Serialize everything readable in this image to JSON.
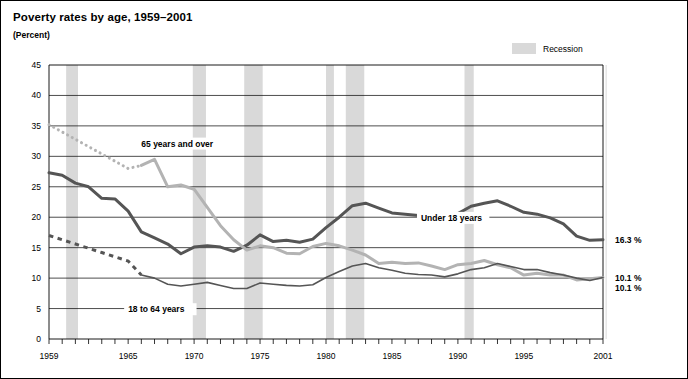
{
  "header": {
    "title": "Poverty rates by age,  1959–2001",
    "subtitle": "(Percent)"
  },
  "legend": {
    "recession_label": "Recession",
    "recession_color": "#d9d9d9"
  },
  "chart_data": {
    "type": "line",
    "title": "Poverty rates by age,  1959–2001",
    "subtitle": "(Percent)",
    "xlabel": "",
    "ylabel": "Percent",
    "xlim": [
      1959,
      2001
    ],
    "ylim": [
      0,
      45
    ],
    "ytick_values": [
      0,
      5,
      10,
      15,
      20,
      25,
      30,
      35,
      40,
      45
    ],
    "ytick_labels": [
      "0",
      "5",
      "10",
      "15",
      "20",
      "25",
      "30",
      "35",
      "40",
      "45"
    ],
    "xtick_values": [
      1959,
      1965,
      1970,
      1975,
      1980,
      1985,
      1990,
      1995,
      2001
    ],
    "xtick_labels": [
      "1959",
      "1965",
      "1970",
      "1975",
      "1980",
      "1985",
      "1990",
      "1995",
      "2001"
    ],
    "minor_xticks_every": 1,
    "grid": "horizontal",
    "legend_position": "top-right",
    "x": [
      1959,
      1960,
      1961,
      1962,
      1963,
      1964,
      1965,
      1966,
      1967,
      1968,
      1969,
      1970,
      1971,
      1972,
      1973,
      1974,
      1975,
      1976,
      1977,
      1978,
      1979,
      1980,
      1981,
      1982,
      1983,
      1984,
      1985,
      1986,
      1987,
      1988,
      1989,
      1990,
      1991,
      1992,
      1993,
      1994,
      1995,
      1996,
      1997,
      1998,
      1999,
      2000,
      2001
    ],
    "series": [
      {
        "name": "Under 18 years",
        "color": "#555555",
        "width": 3.0,
        "style": "solid",
        "label_x": 1987.2,
        "label_y": 19.4,
        "end_value_label": "16.3 %",
        "values": [
          27.3,
          26.9,
          25.6,
          25.0,
          23.1,
          23.0,
          21.0,
          17.6,
          16.6,
          15.6,
          14.0,
          15.1,
          15.3,
          15.1,
          14.4,
          15.4,
          17.1,
          16.0,
          16.2,
          15.9,
          16.4,
          18.3,
          20.0,
          21.9,
          22.3,
          21.5,
          20.7,
          20.5,
          20.3,
          19.5,
          19.6,
          20.6,
          21.8,
          22.3,
          22.7,
          21.8,
          20.8,
          20.5,
          19.9,
          18.9,
          16.9,
          16.2,
          16.3
        ]
      },
      {
        "name": "65 years and over",
        "color": "#b3b3b3",
        "width": 3.0,
        "style": "solid-with-dotted-lead",
        "dotted_from": 1959,
        "dotted_to": 1966,
        "label_x": 1966.0,
        "label_y": 31.6,
        "end_value_label": "10.1 %",
        "values": [
          35.2,
          34.0,
          32.8,
          31.6,
          30.4,
          29.2,
          28.0,
          28.5,
          29.5,
          25.0,
          25.3,
          24.6,
          21.6,
          18.6,
          16.3,
          14.6,
          15.3,
          15.0,
          14.1,
          14.0,
          15.2,
          15.7,
          15.3,
          14.6,
          13.8,
          12.4,
          12.6,
          12.4,
          12.5,
          12.0,
          11.4,
          12.2,
          12.4,
          12.9,
          12.2,
          11.7,
          10.5,
          10.8,
          10.5,
          10.5,
          9.7,
          9.9,
          10.1
        ]
      },
      {
        "name": "18 to 64 years",
        "color": "#555555",
        "width": 1.6,
        "style": "solid-with-dashed-lead",
        "dashed_from": 1959,
        "dashed_to": 1966,
        "label_x": 1965.0,
        "label_y": 4.4,
        "end_value_label": "10.1 %",
        "values": [
          17.0,
          16.3,
          15.6,
          14.9,
          14.2,
          13.5,
          12.8,
          10.5,
          10.0,
          9.0,
          8.7,
          9.0,
          9.3,
          8.8,
          8.3,
          8.3,
          9.2,
          9.0,
          8.8,
          8.7,
          8.9,
          10.1,
          11.1,
          12.0,
          12.4,
          11.7,
          11.3,
          10.8,
          10.6,
          10.5,
          10.2,
          10.7,
          11.4,
          11.7,
          12.4,
          11.9,
          11.4,
          11.4,
          10.9,
          10.5,
          10.0,
          9.6,
          10.1
        ]
      }
    ],
    "recession_bands": [
      {
        "start": 1960.3,
        "end": 1961.2
      },
      {
        "start": 1969.9,
        "end": 1970.9
      },
      {
        "start": 1973.8,
        "end": 1975.2
      },
      {
        "start": 1980.0,
        "end": 1980.6
      },
      {
        "start": 1981.5,
        "end": 1982.9
      },
      {
        "start": 1990.5,
        "end": 1991.2
      },
      {
        "start": 2001.2,
        "end": 2001.9
      }
    ]
  }
}
